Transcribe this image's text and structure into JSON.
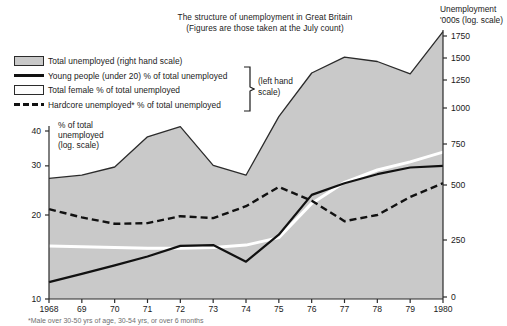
{
  "title": {
    "line1": "The structure of unemployment in Great Britain",
    "line2": "(Figures are those taken at the July count)"
  },
  "right_axis_title": {
    "line1": "Unemployment",
    "line2": "'000s  (log. scale)"
  },
  "left_axis_title": {
    "line1": "% of total",
    "line2": "unemployed",
    "line3": "(log. scale)"
  },
  "legend": {
    "items": [
      {
        "key": "area-swatch",
        "label": "Total unemployed (right hand scale)"
      },
      {
        "key": "solid-line",
        "label": "Young people (under 20) % of total unemployed"
      },
      {
        "key": "white-line",
        "label": "Total female % of total unemployed"
      },
      {
        "key": "dashed-line",
        "label": "Hardcore unemployed* % of total unemployed"
      }
    ],
    "brace_label_line1": "(left hand",
    "brace_label_line2": "scale)"
  },
  "footnote": "*Male over 30-50 yrs of age, 30-54 yrs, or over 6 months",
  "colors": {
    "area_fill": "#c9c9c9",
    "area_stroke": "#2b2b2b",
    "young_line": "#111111",
    "female_line": "#ffffff",
    "hardcore_line": "#111111",
    "axis": "#2b2b2b",
    "background": "#ffffff"
  },
  "chart_data": {
    "type": "line",
    "title": "The structure of unemployment in Great Britain",
    "subtitle": "(Figures are those taken at the July count)",
    "xlabel": "",
    "ylabel": "% of total unemployed (log. scale)",
    "y2label": "Unemployment '000s (log. scale)",
    "grid": false,
    "legend_position": "top-left",
    "x": [
      1968,
      1969,
      1970,
      1971,
      1972,
      1973,
      1974,
      1975,
      1976,
      1977,
      1978,
      1979,
      1980
    ],
    "xtick_labels": [
      "1968",
      "69",
      "70",
      "71",
      "72",
      "73",
      "74",
      "75",
      "76",
      "77",
      "78",
      "79",
      "1980"
    ],
    "y_left_scale": "log",
    "ylim": [
      10,
      40
    ],
    "ytick_labels_left": [
      "40",
      "30",
      "20",
      "10"
    ],
    "ytick_values_left": [
      40,
      30,
      20,
      10
    ],
    "y_right_scale": "log",
    "y2lim": [
      0,
      1750
    ],
    "ytick_labels_right": [
      "1750",
      "1500",
      "1250",
      "1000",
      "750",
      "500",
      "250",
      "0"
    ],
    "ytick_values_right": [
      1750,
      1500,
      1250,
      1000,
      750,
      500,
      250,
      0
    ],
    "series": [
      {
        "name": "Total unemployed (right hand scale)",
        "axis": "right",
        "style": "area",
        "unit": "'000s",
        "values": [
          540,
          560,
          610,
          800,
          870,
          620,
          560,
          940,
          1330,
          1510,
          1460,
          1320,
          1800
        ]
      },
      {
        "name": "Young people (under 20) % of total unemployed",
        "axis": "left",
        "style": "solid",
        "unit": "%",
        "values": [
          11.5,
          12.3,
          13.2,
          14.2,
          15.5,
          15.6,
          13.6,
          17.0,
          23.6,
          26.0,
          28.0,
          29.6,
          30.0
        ]
      },
      {
        "name": "Total female % of total unemployed",
        "axis": "left",
        "style": "white",
        "unit": "%",
        "values": [
          15.5,
          15.4,
          15.3,
          15.2,
          15.2,
          15.3,
          15.6,
          16.6,
          22.0,
          26.2,
          29.0,
          31.0,
          33.6
        ]
      },
      {
        "name": "Hardcore unemployed* % of total unemployed",
        "axis": "left",
        "style": "dashed",
        "unit": "%",
        "values": [
          21.0,
          19.6,
          18.6,
          18.7,
          19.8,
          19.5,
          21.5,
          25.2,
          22.5,
          19.0,
          20.0,
          23.2,
          26.0
        ]
      }
    ],
    "annotations": [
      {
        "text": "(left hand scale)",
        "target": "left-axis series group"
      }
    ]
  }
}
